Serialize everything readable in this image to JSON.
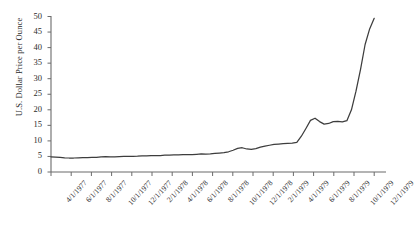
{
  "chart_data": {
    "type": "line",
    "title": "",
    "xlabel": "",
    "ylabel": "U.S. Dollar Price per Ounce",
    "ylim": [
      0,
      50
    ],
    "yticks": [
      0,
      5,
      10,
      15,
      20,
      25,
      30,
      35,
      40,
      45,
      50
    ],
    "ytick_labels": [
      "0",
      "5",
      "10",
      "15",
      "20",
      "25",
      "30",
      "35",
      "40",
      "45",
      "50"
    ],
    "grid": false,
    "legend": null,
    "line_color": "#3d3d3d",
    "axis_color": "#6b6b6b",
    "xtick_labels": [
      "4/1/1977",
      "6/1/1977",
      "8/1/1977",
      "10/1/1977",
      "12/1/1977",
      "2/1/1978",
      "4/1/1978",
      "6/1/1978",
      "8/1/1978",
      "10/1/1978",
      "12/1/1978",
      "2/1/1979",
      "4/1/1979",
      "6/1/1979",
      "8/1/1979",
      "10/1/1979",
      "12/1/1979"
    ],
    "x": [
      "4/1/1977",
      "5/1/1977",
      "6/1/1977",
      "7/1/1977",
      "8/1/1977",
      "9/1/1977",
      "10/1/1977",
      "11/1/1977",
      "12/1/1977",
      "1/1/1978",
      "2/1/1978",
      "3/1/1978",
      "4/1/1978",
      "5/1/1978",
      "6/1/1978",
      "7/1/1978",
      "8/1/1978",
      "9/1/1978",
      "10/1/1978",
      "11/1/1978",
      "12/1/1978",
      "1/1/1979",
      "2/1/1979",
      "3/1/1979",
      "4/1/1979",
      "5/1/1979",
      "6/1/1979",
      "7/1/1979",
      "8/1/1979",
      "9/1/1979",
      "10/1/1979",
      "11/1/1979",
      "12/1/1979",
      "1/1/1980"
    ],
    "values": [
      4.9,
      4.7,
      4.5,
      4.5,
      4.6,
      4.6,
      4.7,
      4.8,
      4.9,
      4.9,
      5.0,
      5.0,
      5.1,
      5.2,
      5.2,
      5.3,
      5.4,
      5.4,
      5.5,
      5.6,
      5.6,
      5.8,
      6.0,
      6.2,
      6.9,
      7.8,
      7.3,
      8.0,
      9.0,
      9.3,
      16.8,
      15.3,
      16.3,
      49.5
    ],
    "series_name": "Silver price",
    "points_px": "4.9,4.8,4.7,4.55,4.5,4.5,4.55,4.6,4.62,4.68,4.72,4.9,4.92,4.88,4.9,4.95,5.0,5.05,5.05,5.1,5.2,5.2,5.25,5.3,5.3,5.4,5.45,5.5,5.5,5.55,5.6,5.6,5.7,5.8,5.75,5.85,6.0,6.1,6.2,6.5,7.0,7.6,7.8,7.4,7.3,7.5,8.0,8.3,8.6,8.9,9.0,9.1,9.2,9.3,9.5,11.5,14.0,16.6,17.3,16.2,15.4,15.6,16.2,16.3,16.1,16.5,20.0,26.0,33.0,41.0,46.0,49.4"
  }
}
